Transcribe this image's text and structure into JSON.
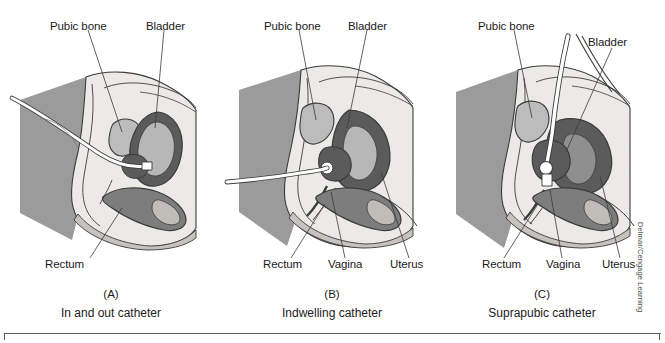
{
  "figure": {
    "credit": "Delmar/Cengage Learning",
    "colors": {
      "skin_light": "#eceae7",
      "skin_mid": "#d6d3ce",
      "drape_gray": "#9b9b9b",
      "organ_dark": "#5b5b5b",
      "organ_mid": "#7d7d7d",
      "organ_light": "#b7b7b7",
      "bone_fill": "#bcbcbc",
      "outline": "#3b3b3b",
      "catheter": "#ffffff",
      "rule": "#5a5f66"
    }
  },
  "panels": [
    {
      "id": "A",
      "letter": "(A)",
      "caption": "In and out catheter",
      "labels": [
        {
          "name": "pubic-bone",
          "text": "Pubic bone"
        },
        {
          "name": "bladder",
          "text": "Bladder"
        },
        {
          "name": "rectum",
          "text": "Rectum"
        }
      ]
    },
    {
      "id": "B",
      "letter": "(B)",
      "caption": "Indwelling catheter",
      "labels": [
        {
          "name": "pubic-bone",
          "text": "Pubic bone"
        },
        {
          "name": "bladder",
          "text": "Bladder"
        },
        {
          "name": "rectum",
          "text": "Rectum"
        },
        {
          "name": "vagina",
          "text": "Vagina"
        },
        {
          "name": "uterus",
          "text": "Uterus"
        }
      ]
    },
    {
      "id": "C",
      "letter": "(C)",
      "caption": "Suprapubic catheter",
      "labels": [
        {
          "name": "pubic-bone",
          "text": "Pubic bone"
        },
        {
          "name": "bladder",
          "text": "Bladder"
        },
        {
          "name": "rectum",
          "text": "Rectum"
        },
        {
          "name": "vagina",
          "text": "Vagina"
        },
        {
          "name": "uterus",
          "text": "Uterus"
        }
      ]
    }
  ]
}
